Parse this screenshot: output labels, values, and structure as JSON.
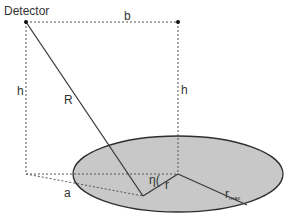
{
  "diagram": {
    "labels": {
      "detector": "Detector",
      "b": "b",
      "h_left": "h",
      "h_right": "h",
      "R": "R",
      "a": "a",
      "eta": "η(",
      "r": "r",
      "r_max_main": "r",
      "r_max_sub": "max"
    },
    "colors": {
      "line": "#3a3a3a",
      "dotted": "#555555",
      "ellipse_fill": "#c8c8c8",
      "ellipse_stroke": "#2e2e2e",
      "text": "#333333",
      "background": "#ffffff"
    },
    "points": {
      "detector": [
        26,
        22
      ],
      "top_right": [
        178,
        22
      ],
      "floor_left": [
        26,
        174
      ],
      "ellipse_center": [
        178,
        174
      ],
      "source_point": [
        143,
        196
      ],
      "rmax_end": [
        247,
        205
      ]
    },
    "ellipse": {
      "cx": 178,
      "cy": 174,
      "rx": 105,
      "ry": 38
    }
  }
}
